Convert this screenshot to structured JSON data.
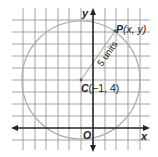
{
  "diagram": {
    "type": "coordinate-plane-circle",
    "axes": {
      "x_label": "x",
      "y_label": "y",
      "origin_label": "O"
    },
    "grid": {
      "unit_px": 11.7,
      "x_range": [
        -7,
        4
      ],
      "y_range": [
        -1,
        10
      ],
      "color": "#9a9a9a"
    },
    "circle": {
      "center": {
        "x": -1,
        "y": 4
      },
      "radius": 5,
      "color": "#aaaaaa"
    },
    "center_point": {
      "name": "C",
      "coords_label": "(−1, 4)"
    },
    "point_p": {
      "name": "P",
      "coords_label": "(x, y)"
    },
    "radius_label": "5 units",
    "axis_color": "#222222"
  }
}
